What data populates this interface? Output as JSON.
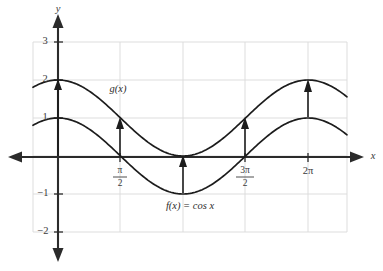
{
  "chart_data": {
    "type": "line",
    "title": "",
    "subtitle": "",
    "xlabel": "x",
    "ylabel": "y",
    "xlim": [
      -0.6,
      7.4
    ],
    "ylim": [
      -2,
      3
    ],
    "grid": true,
    "legend_position": "inline-annotations",
    "x_tick_labels": [
      {
        "value": 1.5708,
        "label": "π/2",
        "numerator": "π",
        "denominator": "2",
        "is_fraction": true
      },
      {
        "value": 4.7124,
        "label": "3π/2",
        "numerator": "3π",
        "denominator": "2",
        "is_fraction": true
      },
      {
        "value": 6.2832,
        "label": "2π",
        "is_fraction": false
      }
    ],
    "y_tick_labels": [
      {
        "value": 3,
        "label": "3"
      },
      {
        "value": 2,
        "label": "2"
      },
      {
        "value": 1,
        "label": "1"
      },
      {
        "value": -1,
        "label": "-1"
      },
      {
        "value": -2,
        "label": "-2"
      }
    ],
    "series": [
      {
        "name": "f(x) = cos x",
        "annotation": "f(x) = cos x",
        "formula": "cos(x)",
        "amplitude": 1,
        "vertical_shift": 0,
        "period": 6.2832,
        "key_points": [
          {
            "x": 0,
            "y": 1
          },
          {
            "x": 1.5708,
            "y": 0
          },
          {
            "x": 3.1416,
            "y": -1
          },
          {
            "x": 4.7124,
            "y": 0
          },
          {
            "x": 6.2832,
            "y": 1
          }
        ]
      },
      {
        "name": "g(x)",
        "annotation": "g(x)",
        "formula": "cos(x) + 1",
        "amplitude": 1,
        "vertical_shift": 1,
        "period": 6.2832,
        "key_points": [
          {
            "x": 0,
            "y": 2
          },
          {
            "x": 1.5708,
            "y": 1
          },
          {
            "x": 3.1416,
            "y": 0
          },
          {
            "x": 4.7124,
            "y": 1
          },
          {
            "x": 6.2832,
            "y": 2
          }
        ]
      }
    ],
    "shift_arrows": [
      {
        "x": 0,
        "y_from": 0,
        "y_to": 2,
        "length": 2
      },
      {
        "x": 1.5708,
        "y_from": 0,
        "y_to": 1,
        "length": 1
      },
      {
        "x": 3.1416,
        "y_from": -1,
        "y_to": 0,
        "length": 1
      },
      {
        "x": 4.7124,
        "y_from": 0,
        "y_to": 1,
        "length": 1
      },
      {
        "x": 6.2832,
        "y_from": 1,
        "y_to": 2,
        "length": 1
      }
    ]
  },
  "annotations": {
    "f_label": "f(x) = cos x",
    "g_label": "g(x)",
    "x_axis_label": "x",
    "y_axis_label": "y"
  },
  "ticks": {
    "pi_over_2_num": "π",
    "pi_over_2_den": "2",
    "three_pi_over_2_num": "3π",
    "three_pi_over_2_den": "2",
    "two_pi": "2π",
    "y3": "3",
    "y2": "2",
    "y1": "1",
    "yneg1": "−1",
    "yneg2": "−2"
  },
  "colors": {
    "curve": "#1c1c1c",
    "axis": "#2b2b2b",
    "grid": "#d9d9d9",
    "background": "#ffffff",
    "text": "#3a3a3a"
  }
}
